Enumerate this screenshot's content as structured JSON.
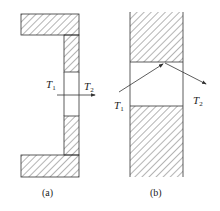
{
  "figure": {
    "panel_a": {
      "caption": "(a)",
      "t1": "T",
      "t1_sub": "1",
      "t2": "T",
      "t2_sub": "2"
    },
    "panel_b": {
      "caption": "(b)",
      "t1": "T",
      "t1_sub": "1",
      "t2": "T",
      "t2_sub": "2"
    }
  },
  "colors": {
    "stroke": "#333333",
    "background": "#ffffff"
  }
}
